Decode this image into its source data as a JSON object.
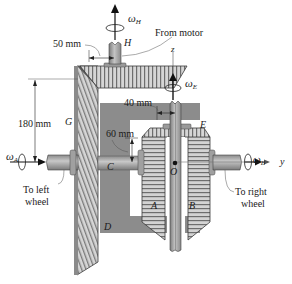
{
  "diagram": {
    "type": "mechanical-differential-gear-assembly",
    "dimensions": {
      "d_50": "50 mm",
      "d_180": "180 mm",
      "d_40": "40 mm",
      "d_60": "60 mm"
    },
    "callouts": {
      "from_motor": "From motor",
      "to_left_wheel_1": "To left",
      "to_left_wheel_2": "wheel",
      "to_right_wheel_1": "To right",
      "to_right_wheel_2": "wheel"
    },
    "gear_labels": {
      "H": "H",
      "G": "G",
      "E": "E",
      "C": "C",
      "D": "D",
      "A": "A",
      "B": "B",
      "O": "O"
    },
    "axes": {
      "z": "z",
      "y": "y"
    },
    "angular_velocities": {
      "omega_H": "ω",
      "omega_H_sub": "H",
      "omega_E": "ω",
      "omega_E_sub": "E",
      "omega_A": "ω",
      "omega_A_sub": "A",
      "omega_B": "ω",
      "omega_B_sub": "B"
    },
    "colors": {
      "gear_light": "#d9d9d9",
      "gear_mid": "#9a9a9a",
      "gear_dark": "#5a5a5a",
      "carrier": "#8c8c8c",
      "shaft": "#a8a8a8",
      "line": "#1a1a1a"
    }
  }
}
